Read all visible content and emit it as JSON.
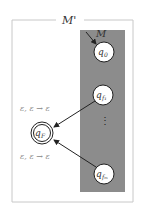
{
  "outer_machine": {
    "label": "M'"
  },
  "inner_machine": {
    "label": "M"
  },
  "states": [
    {
      "id": "q0",
      "label": "q",
      "sub": "0"
    },
    {
      "id": "qf1",
      "label": "q",
      "sub": "f₁"
    },
    {
      "id": "qfm",
      "label": "q",
      "sub": "fₘ"
    },
    {
      "id": "qF",
      "label": "q",
      "sub": "F",
      "accepting": true
    }
  ],
  "ellipsis": "⋮",
  "transitions": [
    {
      "from": "qf1",
      "to": "qF",
      "label": "ε, ε → ε"
    },
    {
      "from": "qfm",
      "to": "qF",
      "label": "ε, ε → ε"
    }
  ],
  "colors": {
    "inner_fill": "#8c8c8c",
    "outer_border": "#c8c8c8",
    "edge": "#222222"
  }
}
